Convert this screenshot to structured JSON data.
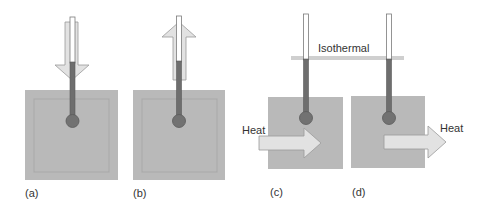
{
  "colors": {
    "box_fill": "#b9b9b9",
    "box_inner_border": "#a9a9a9",
    "arrow_fill": "#e2e2e2",
    "arrow_stroke": "#9a9a9a",
    "tube_fill": "#ffffff",
    "tube_stroke": "#7a7a7a",
    "mercury": "#6e6e6e",
    "bulb": "#727272",
    "isothermal_line": "#cfcfcf",
    "text": "#333333"
  },
  "panels": [
    {
      "id": "a",
      "label": "(a)",
      "arrow": "down",
      "arrow_meaning": "thermometer inserted into sample"
    },
    {
      "id": "b",
      "label": "(b)",
      "arrow": "up",
      "arrow_meaning": "thermometer withdrawn from sample"
    },
    {
      "id": "c",
      "label": "(c)",
      "heat_label": "Heat",
      "heat_direction": "into sample"
    },
    {
      "id": "d",
      "label": "(d)",
      "heat_label": "Heat",
      "heat_direction": "out of sample"
    }
  ],
  "isothermal": {
    "label": "Isothermal"
  }
}
